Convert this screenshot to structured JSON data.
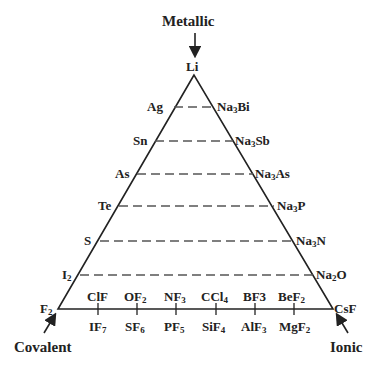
{
  "vertices": {
    "top": {
      "label": "Metallic",
      "compound": "Li"
    },
    "left": {
      "label": "Covalent",
      "compound": "F2"
    },
    "right": {
      "label": "Ionic",
      "compound": "CsF"
    }
  },
  "rows": [
    {
      "left": "Ag",
      "right": "Na3Bi"
    },
    {
      "left": "Sn",
      "right": "Na3Sb"
    },
    {
      "left": "As",
      "right": "Na3As"
    },
    {
      "left": "Te",
      "right": "Na3P"
    },
    {
      "left": "S",
      "right": "Na3N"
    },
    {
      "left": "I2",
      "right": "Na2O"
    }
  ],
  "base_above": [
    "ClF",
    "OF2",
    "NF3",
    "CCl4",
    "BF3",
    "BeF2"
  ],
  "base_below": [
    "IF7",
    "SF6",
    "PF5",
    "SiF4",
    "AlF3",
    "MgF2"
  ],
  "colors": {
    "line": "#222222",
    "text": "#222222",
    "background": "#ffffff"
  }
}
